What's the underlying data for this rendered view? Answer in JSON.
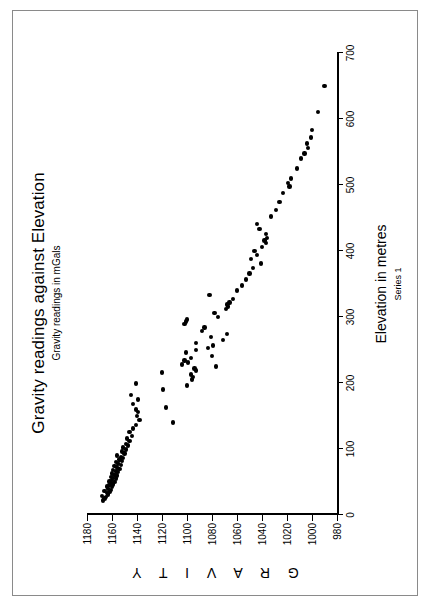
{
  "chart_data": {
    "type": "scatter",
    "title": "Gravity readings against Elevation",
    "subtitle": "Gravity readings in mGals",
    "xlabel": "Elevation in metres",
    "ylabel": "G R A V I T Y",
    "legend": "Series 1",
    "legend_position": "below-x-axis",
    "grid": false,
    "orientation": "rotated-90-ccw",
    "xlim": [
      0,
      700
    ],
    "ylim": [
      980,
      1180
    ],
    "xticks": [
      0,
      100,
      200,
      300,
      400,
      500,
      600,
      700
    ],
    "yticks": [
      980,
      1000,
      1020,
      1040,
      1060,
      1080,
      1100,
      1120,
      1140,
      1160,
      1180
    ],
    "xtick_labels": [
      "0",
      "100",
      "200",
      "300",
      "400",
      "500",
      "600",
      "700"
    ],
    "ytick_labels": [
      "980",
      "1000",
      "1020",
      "1040",
      "1060",
      "1080",
      "1100",
      "1120",
      "1140",
      "1160",
      "1180"
    ],
    "marker": "filled-circle",
    "marker_color": "#000000",
    "series": [
      {
        "name": "Series 1",
        "points": [
          [
            22,
            1167
          ],
          [
            25,
            1166
          ],
          [
            27,
            1165
          ],
          [
            29,
            1168
          ],
          [
            31,
            1163
          ],
          [
            33,
            1164
          ],
          [
            35,
            1162
          ],
          [
            36,
            1166
          ],
          [
            38,
            1161
          ],
          [
            40,
            1163
          ],
          [
            42,
            1160
          ],
          [
            43,
            1164
          ],
          [
            45,
            1162
          ],
          [
            46,
            1159
          ],
          [
            48,
            1161
          ],
          [
            50,
            1158
          ],
          [
            51,
            1162
          ],
          [
            53,
            1160
          ],
          [
            55,
            1157
          ],
          [
            56,
            1159
          ],
          [
            58,
            1161
          ],
          [
            60,
            1156
          ],
          [
            61,
            1158
          ],
          [
            63,
            1160
          ],
          [
            65,
            1155
          ],
          [
            66,
            1157
          ],
          [
            68,
            1159
          ],
          [
            70,
            1154
          ],
          [
            72,
            1156
          ],
          [
            74,
            1158
          ],
          [
            76,
            1153
          ],
          [
            78,
            1155
          ],
          [
            80,
            1157
          ],
          [
            82,
            1152
          ],
          [
            84,
            1154
          ],
          [
            86,
            1151
          ],
          [
            88,
            1153
          ],
          [
            90,
            1156
          ],
          [
            93,
            1150
          ],
          [
            96,
            1152
          ],
          [
            99,
            1149
          ],
          [
            102,
            1151
          ],
          [
            105,
            1147
          ],
          [
            108,
            1149
          ],
          [
            112,
            1146
          ],
          [
            116,
            1148
          ],
          [
            120,
            1144
          ],
          [
            126,
            1146
          ],
          [
            131,
            1143
          ],
          [
            136,
            1141
          ],
          [
            140,
            1111
          ],
          [
            144,
            1138
          ],
          [
            150,
            1140
          ],
          [
            156,
            1139
          ],
          [
            160,
            1141
          ],
          [
            163,
            1117
          ],
          [
            168,
            1143
          ],
          [
            175,
            1139
          ],
          [
            182,
            1145
          ],
          [
            190,
            1119
          ],
          [
            196,
            1100
          ],
          [
            199,
            1141
          ],
          [
            205,
            1096
          ],
          [
            209,
            1095
          ],
          [
            213,
            1097
          ],
          [
            216,
            1120
          ],
          [
            219,
            1093
          ],
          [
            222,
            1094
          ],
          [
            225,
            1077
          ],
          [
            228,
            1104
          ],
          [
            231,
            1099
          ],
          [
            234,
            1102
          ],
          [
            238,
            1097
          ],
          [
            241,
            1080
          ],
          [
            246,
            1101
          ],
          [
            250,
            1093
          ],
          [
            253,
            1083
          ],
          [
            257,
            1079
          ],
          [
            261,
            1093
          ],
          [
            265,
            1071
          ],
          [
            270,
            1081
          ],
          [
            274,
            1068
          ],
          [
            279,
            1088
          ],
          [
            284,
            1086
          ],
          [
            289,
            1102
          ],
          [
            293,
            1101
          ],
          [
            296,
            1100
          ],
          [
            300,
            1075
          ],
          [
            306,
            1078
          ],
          [
            312,
            1069
          ],
          [
            316,
            1067
          ],
          [
            319,
            1068
          ],
          [
            322,
            1066
          ],
          [
            327,
            1063
          ],
          [
            333,
            1082
          ],
          [
            340,
            1060
          ],
          [
            348,
            1056
          ],
          [
            357,
            1053
          ],
          [
            366,
            1050
          ],
          [
            374,
            1047
          ],
          [
            381,
            1041
          ],
          [
            388,
            1049
          ],
          [
            394,
            1044
          ],
          [
            400,
            1046
          ],
          [
            406,
            1040
          ],
          [
            412,
            1037
          ],
          [
            416,
            1038
          ],
          [
            420,
            1036
          ],
          [
            426,
            1037
          ],
          [
            433,
            1042
          ],
          [
            441,
            1044
          ],
          [
            452,
            1033
          ],
          [
            462,
            1029
          ],
          [
            474,
            1026
          ],
          [
            488,
            1023
          ],
          [
            498,
            1018
          ],
          [
            503,
            1019
          ],
          [
            510,
            1017
          ],
          [
            525,
            1012
          ],
          [
            540,
            1009
          ],
          [
            548,
            1006
          ],
          [
            556,
            1003
          ],
          [
            563,
            1004
          ],
          [
            572,
            1001
          ],
          [
            583,
            1000
          ],
          [
            611,
            995
          ],
          [
            650,
            990
          ]
        ]
      }
    ]
  }
}
